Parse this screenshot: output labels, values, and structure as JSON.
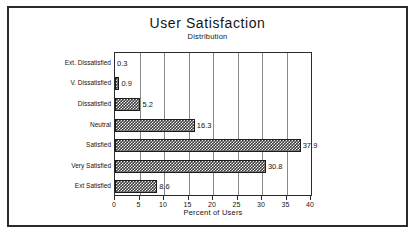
{
  "chart_data": {
    "type": "bar",
    "orientation": "horizontal",
    "title": "User Satisfaction",
    "subtitle": "Distribution",
    "xlabel": "Percent of Users",
    "ylabel": "",
    "xlim": [
      0,
      40
    ],
    "xticks": [
      "0",
      "5",
      "10",
      "15",
      "20",
      "25",
      "30",
      "35",
      "40"
    ],
    "grid": "vertical",
    "legend": "none",
    "categories": [
      "Ext. Dissatisfied",
      "V. Dissatisfied",
      "Dissatisfied",
      "Neutral",
      "Satisfied",
      "Very Satisfied",
      "Ext Satisfied"
    ],
    "values": [
      0.3,
      0.9,
      5.2,
      16.3,
      37.9,
      30.8,
      8.6
    ],
    "value_labels": [
      "0.3",
      "0.9",
      "5.2",
      "16.3",
      "37.9",
      "30.8",
      "8.6"
    ],
    "bar_fill": "#3a3a3a",
    "bar_edge": "#1c1c1c",
    "gridline_color": "#8a8a8a",
    "frame_color": "#2b2b2b"
  }
}
